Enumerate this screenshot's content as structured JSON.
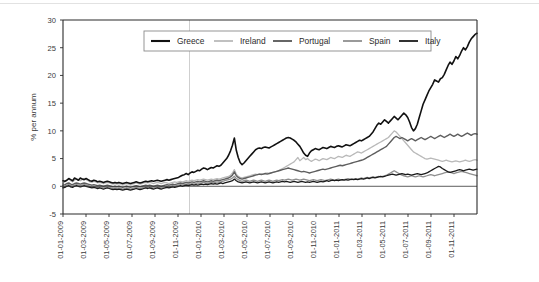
{
  "figure": {
    "background": "#ffffff",
    "caption": ""
  },
  "chart_data": {
    "type": "line",
    "title": "",
    "xlabel": "",
    "ylabel": "% per annum",
    "ylim": [
      -5,
      30
    ],
    "yticks": [
      -5,
      0,
      5,
      10,
      15,
      20,
      25,
      30
    ],
    "grid": false,
    "legend_position": "top-center",
    "xticklabels": [
      "01-01-2009",
      "01-03-2009",
      "01-05-2009",
      "01-07-2009",
      "01-09-2009",
      "01-11-2009",
      "01-01-2010",
      "01-03-2010",
      "01-05-2010",
      "01-07-2010",
      "01-09-2010",
      "01-11-2010",
      "01-01-2011",
      "01-03-2011",
      "01-05-2011",
      "01-07-2011",
      "01-09-2011",
      "01-11-2011"
    ],
    "x_start": "01-01-2009",
    "x_end": "31-12-2011",
    "annotations": [
      {
        "type": "vline",
        "x": "01-12-2009",
        "color": "#c9c9c9"
      }
    ],
    "series": [
      {
        "name": "Greece",
        "color": "#111111",
        "width": 1.6,
        "values": [
          1.0,
          0.9,
          1.1,
          1.4,
          1.2,
          1.0,
          1.5,
          1.3,
          1.1,
          1.5,
          1.3,
          1.2,
          1.4,
          1.2,
          1.0,
          0.9,
          1.1,
          1.0,
          0.8,
          0.9,
          0.8,
          0.7,
          0.8,
          0.9,
          0.8,
          0.7,
          0.6,
          0.7,
          0.6,
          0.7,
          0.6,
          0.5,
          0.6,
          0.7,
          0.6,
          0.5,
          0.6,
          0.7,
          0.8,
          0.7,
          0.6,
          0.7,
          0.8,
          0.9,
          0.8,
          0.9,
          1.0,
          0.9,
          1.0,
          1.1,
          1.0,
          0.9,
          1.0,
          1.1,
          1.2,
          1.1,
          1.2,
          1.3,
          1.4,
          1.5,
          1.6,
          1.8,
          2.0,
          2.1,
          2.3,
          2.1,
          2.4,
          2.6,
          2.5,
          2.7,
          2.9,
          2.8,
          3.1,
          3.3,
          3.2,
          3.0,
          3.2,
          3.4,
          3.3,
          3.5,
          3.7,
          3.6,
          3.8,
          4.2,
          4.6,
          5.0,
          5.6,
          6.4,
          7.4,
          8.7,
          6.5,
          5.2,
          4.3,
          3.9,
          4.2,
          4.6,
          5.0,
          5.4,
          5.8,
          6.2,
          6.6,
          6.8,
          6.9,
          6.8,
          7.0,
          7.1,
          7.0,
          6.9,
          7.1,
          7.3,
          7.5,
          7.7,
          7.9,
          8.1,
          8.3,
          8.5,
          8.7,
          8.8,
          8.7,
          8.5,
          8.3,
          8.0,
          7.6,
          7.2,
          6.6,
          6.0,
          5.6,
          5.4,
          6.0,
          6.4,
          6.6,
          6.8,
          6.7,
          6.6,
          6.8,
          7.0,
          6.9,
          6.8,
          7.0,
          7.2,
          7.1,
          7.0,
          7.2,
          7.3,
          7.2,
          7.1,
          7.3,
          7.5,
          7.4,
          7.3,
          7.5,
          7.7,
          7.9,
          8.1,
          8.3,
          8.2,
          8.4,
          8.6,
          8.8,
          9.0,
          9.4,
          9.8,
          10.4,
          11.0,
          11.4,
          11.2,
          11.6,
          12.0,
          11.7,
          11.4,
          11.8,
          12.2,
          12.6,
          12.3,
          12.0,
          12.4,
          12.8,
          13.2,
          12.9,
          12.4,
          11.6,
          10.6,
          10.0,
          10.4,
          11.2,
          12.4,
          13.6,
          14.8,
          15.6,
          16.4,
          17.2,
          17.8,
          18.4,
          19.2,
          19.0,
          18.8,
          19.4,
          19.6,
          20.2,
          21.0,
          21.8,
          22.4,
          22.0,
          22.6,
          23.4,
          23.0,
          23.6,
          24.4,
          25.0,
          24.6,
          25.2,
          26.0,
          26.6,
          27.0,
          27.4,
          27.6
        ]
      },
      {
        "name": "Ireland",
        "color": "#b9b9b9",
        "width": 1.3,
        "values": [
          0.5,
          0.8,
          1.1,
          1.3,
          1.0,
          0.8,
          1.1,
          1.4,
          1.2,
          1.0,
          1.2,
          1.4,
          1.2,
          1.0,
          0.8,
          0.7,
          0.9,
          0.8,
          0.6,
          0.7,
          0.6,
          0.5,
          0.6,
          0.7,
          0.6,
          0.5,
          0.4,
          0.5,
          0.4,
          0.5,
          0.4,
          0.3,
          0.4,
          0.5,
          0.4,
          0.3,
          0.4,
          0.5,
          0.6,
          0.5,
          0.4,
          0.5,
          0.6,
          0.7,
          0.6,
          0.7,
          0.6,
          0.5,
          0.6,
          0.7,
          0.6,
          0.5,
          0.6,
          0.7,
          0.6,
          0.5,
          0.6,
          0.7,
          0.8,
          0.7,
          0.8,
          0.9,
          0.8,
          0.9,
          1.0,
          0.9,
          1.0,
          1.1,
          1.0,
          1.1,
          1.2,
          1.1,
          1.2,
          1.3,
          1.2,
          1.1,
          1.2,
          1.3,
          1.2,
          1.3,
          1.4,
          1.3,
          1.4,
          1.5,
          1.6,
          1.7,
          1.8,
          2.0,
          2.4,
          3.0,
          2.2,
          1.8,
          1.6,
          1.5,
          1.6,
          1.7,
          1.8,
          1.9,
          2.0,
          2.1,
          2.2,
          2.1,
          2.2,
          2.3,
          2.2,
          2.3,
          2.4,
          2.3,
          2.4,
          2.5,
          2.6,
          2.7,
          2.8,
          3.0,
          3.2,
          3.4,
          3.6,
          3.8,
          4.0,
          4.2,
          4.4,
          4.8,
          5.2,
          4.6,
          4.9,
          5.2,
          4.8,
          5.0,
          4.7,
          4.5,
          4.7,
          4.9,
          4.8,
          4.6,
          4.8,
          5.0,
          4.9,
          4.8,
          5.0,
          5.2,
          5.1,
          5.0,
          5.2,
          5.4,
          5.3,
          5.2,
          5.4,
          5.6,
          5.5,
          5.4,
          5.6,
          5.8,
          6.0,
          6.2,
          6.1,
          6.0,
          6.2,
          6.4,
          6.6,
          6.8,
          7.0,
          7.2,
          7.4,
          7.6,
          7.8,
          8.0,
          8.2,
          8.4,
          8.6,
          8.8,
          9.2,
          9.6,
          10.0,
          9.8,
          9.4,
          9.0,
          8.6,
          8.2,
          7.8,
          7.4,
          7.0,
          6.6,
          6.2,
          6.0,
          5.8,
          5.6,
          5.4,
          5.2,
          5.0,
          4.9,
          5.0,
          5.1,
          5.0,
          4.9,
          4.8,
          4.7,
          4.6,
          4.5,
          4.6,
          4.7,
          4.6,
          4.5,
          4.4,
          4.5,
          4.6,
          4.5,
          4.4,
          4.5,
          4.6,
          4.7,
          4.6,
          4.5,
          4.6,
          4.7,
          4.8,
          4.7
        ]
      },
      {
        "name": "Portugal",
        "color": "#5e5e5e",
        "width": 1.4,
        "values": [
          0.2,
          0.3,
          0.5,
          0.6,
          0.4,
          0.3,
          0.5,
          0.6,
          0.5,
          0.4,
          0.5,
          0.6,
          0.5,
          0.4,
          0.3,
          0.2,
          0.3,
          0.2,
          0.1,
          0.2,
          0.1,
          0.0,
          0.1,
          0.2,
          0.1,
          0.0,
          -0.1,
          0.0,
          -0.1,
          0.0,
          -0.1,
          -0.2,
          -0.1,
          0.0,
          -0.1,
          -0.2,
          -0.1,
          0.0,
          0.1,
          0.0,
          -0.1,
          0.0,
          0.1,
          0.2,
          0.1,
          0.2,
          0.1,
          0.0,
          0.1,
          0.2,
          0.1,
          0.0,
          0.1,
          0.2,
          0.3,
          0.2,
          0.3,
          0.4,
          0.3,
          0.4,
          0.5,
          0.6,
          0.5,
          0.6,
          0.7,
          0.6,
          0.7,
          0.8,
          0.7,
          0.8,
          0.9,
          0.8,
          0.9,
          1.0,
          0.9,
          0.8,
          0.9,
          1.0,
          0.9,
          1.0,
          1.1,
          1.0,
          1.1,
          1.2,
          1.3,
          1.4,
          1.5,
          1.7,
          2.0,
          2.6,
          1.9,
          1.6,
          1.4,
          1.3,
          1.4,
          1.5,
          1.6,
          1.7,
          1.8,
          1.9,
          2.0,
          2.1,
          2.2,
          2.1,
          2.2,
          2.3,
          2.2,
          2.3,
          2.4,
          2.5,
          2.6,
          2.7,
          2.8,
          2.9,
          3.0,
          3.1,
          3.2,
          3.3,
          3.2,
          3.1,
          3.0,
          2.9,
          2.8,
          2.7,
          2.6,
          2.7,
          2.6,
          2.5,
          2.4,
          2.5,
          2.6,
          2.7,
          2.8,
          2.9,
          3.0,
          3.1,
          3.0,
          3.1,
          3.2,
          3.3,
          3.4,
          3.5,
          3.6,
          3.7,
          3.8,
          3.7,
          3.8,
          3.9,
          4.0,
          4.1,
          4.2,
          4.3,
          4.4,
          4.5,
          4.6,
          4.7,
          4.8,
          5.0,
          5.2,
          5.4,
          5.6,
          5.8,
          6.0,
          6.2,
          6.4,
          6.6,
          6.8,
          7.0,
          7.2,
          7.6,
          8.0,
          8.4,
          8.8,
          9.0,
          8.8,
          8.6,
          8.8,
          8.6,
          8.4,
          8.2,
          8.4,
          8.6,
          8.4,
          8.2,
          8.4,
          8.6,
          8.8,
          8.6,
          8.4,
          8.6,
          8.8,
          9.0,
          8.8,
          8.6,
          8.8,
          9.0,
          9.2,
          9.0,
          8.8,
          9.0,
          9.2,
          9.4,
          9.2,
          9.0,
          9.2,
          9.4,
          9.2,
          9.0,
          9.2,
          9.4,
          9.6,
          9.4,
          9.2,
          9.4,
          9.5,
          9.4
        ]
      },
      {
        "name": "Spain",
        "color": "#8f8f8f",
        "width": 1.3,
        "values": [
          -0.2,
          0.0,
          0.2,
          0.3,
          0.1,
          0.0,
          0.2,
          0.3,
          0.2,
          0.1,
          0.2,
          0.3,
          0.2,
          0.1,
          0.0,
          -0.1,
          0.0,
          -0.1,
          -0.2,
          -0.1,
          -0.2,
          -0.3,
          -0.2,
          -0.1,
          -0.2,
          -0.3,
          -0.4,
          -0.3,
          -0.4,
          -0.3,
          -0.4,
          -0.5,
          -0.4,
          -0.3,
          -0.4,
          -0.5,
          -0.4,
          -0.3,
          -0.2,
          -0.3,
          -0.4,
          -0.3,
          -0.2,
          -0.1,
          -0.2,
          -0.1,
          -0.2,
          -0.3,
          -0.2,
          -0.1,
          -0.2,
          -0.3,
          -0.2,
          -0.1,
          0.0,
          -0.1,
          0.0,
          0.1,
          0.0,
          0.1,
          0.2,
          0.3,
          0.2,
          0.3,
          0.4,
          0.3,
          0.4,
          0.5,
          0.4,
          0.5,
          0.6,
          0.5,
          0.6,
          0.7,
          0.6,
          0.5,
          0.6,
          0.7,
          0.6,
          0.7,
          0.8,
          0.7,
          0.8,
          0.9,
          1.0,
          1.1,
          1.2,
          1.3,
          1.5,
          1.8,
          1.4,
          1.2,
          1.0,
          0.9,
          1.0,
          1.1,
          1.0,
          0.9,
          1.0,
          1.1,
          1.0,
          0.9,
          1.0,
          1.1,
          1.0,
          0.9,
          1.0,
          1.1,
          1.0,
          0.9,
          1.0,
          1.1,
          1.0,
          1.1,
          1.2,
          1.1,
          1.2,
          1.3,
          1.2,
          1.1,
          1.2,
          1.3,
          1.2,
          1.1,
          1.2,
          1.3,
          1.2,
          1.1,
          1.0,
          1.1,
          1.2,
          1.1,
          1.0,
          1.1,
          1.2,
          1.1,
          1.0,
          1.1,
          1.2,
          1.3,
          1.2,
          1.1,
          1.2,
          1.3,
          1.2,
          1.1,
          1.2,
          1.3,
          1.4,
          1.3,
          1.2,
          1.3,
          1.4,
          1.3,
          1.4,
          1.5,
          1.4,
          1.5,
          1.6,
          1.5,
          1.6,
          1.7,
          1.6,
          1.7,
          1.8,
          1.7,
          1.8,
          1.9,
          2.0,
          2.2,
          2.4,
          2.6,
          2.8,
          2.6,
          2.4,
          2.2,
          2.0,
          1.9,
          1.8,
          1.7,
          1.8,
          1.9,
          1.8,
          1.7,
          1.8,
          1.9,
          1.8,
          1.7,
          1.8,
          1.9,
          2.0,
          2.1,
          2.0,
          1.9,
          2.0,
          2.1,
          2.2,
          2.3,
          2.4,
          2.5,
          2.6,
          2.5,
          2.4,
          2.3,
          2.4,
          2.5,
          2.6,
          2.7,
          2.6,
          2.5,
          2.4,
          2.3,
          2.2,
          2.1,
          2.0,
          1.9
        ]
      },
      {
        "name": "Italy",
        "color": "#1a1a1a",
        "width": 1.3,
        "values": [
          -0.3,
          -0.2,
          0.0,
          0.1,
          -0.1,
          -0.2,
          0.0,
          0.1,
          0.0,
          -0.1,
          0.0,
          0.1,
          0.0,
          -0.1,
          -0.2,
          -0.3,
          -0.2,
          -0.3,
          -0.4,
          -0.3,
          -0.4,
          -0.5,
          -0.4,
          -0.3,
          -0.4,
          -0.5,
          -0.6,
          -0.5,
          -0.6,
          -0.5,
          -0.6,
          -0.7,
          -0.6,
          -0.5,
          -0.6,
          -0.7,
          -0.6,
          -0.5,
          -0.4,
          -0.5,
          -0.6,
          -0.5,
          -0.4,
          -0.3,
          -0.4,
          -0.3,
          -0.4,
          -0.5,
          -0.4,
          -0.3,
          -0.4,
          -0.5,
          -0.4,
          -0.3,
          -0.2,
          -0.3,
          -0.2,
          -0.1,
          -0.2,
          -0.1,
          0.0,
          0.1,
          0.0,
          0.1,
          0.2,
          0.1,
          0.2,
          0.3,
          0.2,
          0.3,
          0.2,
          0.3,
          0.4,
          0.3,
          0.4,
          0.3,
          0.4,
          0.5,
          0.4,
          0.5,
          0.4,
          0.5,
          0.6,
          0.5,
          0.6,
          0.7,
          0.8,
          0.9,
          1.0,
          1.3,
          1.0,
          0.8,
          0.7,
          0.6,
          0.7,
          0.8,
          0.7,
          0.6,
          0.7,
          0.8,
          0.7,
          0.6,
          0.7,
          0.8,
          0.7,
          0.6,
          0.7,
          0.8,
          0.7,
          0.6,
          0.7,
          0.8,
          0.7,
          0.8,
          0.9,
          0.8,
          0.9,
          0.8,
          0.7,
          0.8,
          0.9,
          0.8,
          0.7,
          0.8,
          0.9,
          0.8,
          0.7,
          0.8,
          0.7,
          0.8,
          0.9,
          0.8,
          0.7,
          0.8,
          0.9,
          0.8,
          0.9,
          1.0,
          0.9,
          1.0,
          1.1,
          1.0,
          1.1,
          1.0,
          1.1,
          1.2,
          1.1,
          1.2,
          1.1,
          1.2,
          1.3,
          1.2,
          1.3,
          1.2,
          1.3,
          1.4,
          1.3,
          1.4,
          1.5,
          1.4,
          1.5,
          1.6,
          1.5,
          1.6,
          1.7,
          1.8,
          1.7,
          1.8,
          1.9,
          2.0,
          2.1,
          2.2,
          2.1,
          2.0,
          2.1,
          2.2,
          2.3,
          2.2,
          2.1,
          2.2,
          2.1,
          2.0,
          2.1,
          2.2,
          2.3,
          2.2,
          2.1,
          2.2,
          2.3,
          2.4,
          2.6,
          2.8,
          3.0,
          3.2,
          3.4,
          3.6,
          3.5,
          3.2,
          3.0,
          2.8,
          2.6,
          2.5,
          2.6,
          2.7,
          2.8,
          2.9,
          3.0,
          2.9,
          2.8,
          2.9,
          3.0,
          3.1,
          3.0,
          2.9,
          3.0,
          3.1
        ]
      }
    ]
  }
}
